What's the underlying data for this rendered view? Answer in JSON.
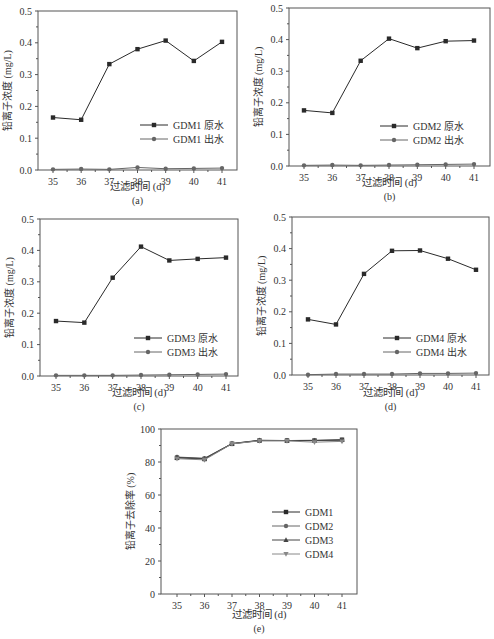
{
  "figure": {
    "caption_partial": "铅离子浓度及去除率随过滤时间变化规律"
  },
  "chart_data": [
    {
      "panel": "(a)",
      "type": "line",
      "xlabel": "过滤时间 (d)",
      "ylabel": "铅离子浓度 (mg/L)",
      "x": [
        35,
        36,
        37,
        38,
        39,
        40,
        41
      ],
      "xticks": [
        "35",
        "36",
        "37",
        "38",
        "39",
        "40",
        "41"
      ],
      "yticks": [
        "0.0",
        "0.1",
        "0.2",
        "0.3",
        "0.4",
        "0.5"
      ],
      "ylim": [
        0,
        0.5
      ],
      "legend_position": "center-right",
      "series": [
        {
          "name": "GDM1 原水",
          "marker": "square",
          "values": [
            0.165,
            0.158,
            0.333,
            0.38,
            0.407,
            0.343,
            0.403
          ]
        },
        {
          "name": "GDM1 出水",
          "marker": "circle",
          "values": [
            0.002,
            0.003,
            0.002,
            0.008,
            0.004,
            0.005,
            0.006
          ]
        }
      ]
    },
    {
      "panel": "(b)",
      "type": "line",
      "xlabel": "过滤时间 (d)",
      "ylabel": "铅离子浓度 (mg/L)",
      "x": [
        35,
        36,
        37,
        38,
        39,
        40,
        41
      ],
      "xticks": [
        "35",
        "36",
        "37",
        "38",
        "39",
        "40",
        "41"
      ],
      "yticks": [
        "0.0",
        "0.1",
        "0.2",
        "0.3",
        "0.4",
        "0.5"
      ],
      "ylim": [
        0,
        0.5
      ],
      "legend_position": "center-right",
      "series": [
        {
          "name": "GDM2 原水",
          "marker": "square",
          "values": [
            0.176,
            0.168,
            0.333,
            0.403,
            0.373,
            0.395,
            0.397
          ]
        },
        {
          "name": "GDM2 出水",
          "marker": "circle",
          "values": [
            0.002,
            0.003,
            0.002,
            0.003,
            0.004,
            0.005,
            0.006
          ]
        }
      ]
    },
    {
      "panel": "(c)",
      "type": "line",
      "xlabel": "过滤时间 (d)",
      "ylabel": "铅离子浓度 (mg/L)",
      "x": [
        35,
        36,
        37,
        38,
        39,
        40,
        41
      ],
      "xticks": [
        "35",
        "36",
        "37",
        "38",
        "39",
        "40",
        "41"
      ],
      "yticks": [
        "0.0",
        "0.1",
        "0.2",
        "0.3",
        "0.4",
        "0.5"
      ],
      "ylim": [
        0,
        0.5
      ],
      "legend_position": "center-right",
      "series": [
        {
          "name": "GDM3 原水",
          "marker": "square",
          "values": [
            0.175,
            0.17,
            0.313,
            0.412,
            0.368,
            0.373,
            0.377
          ]
        },
        {
          "name": "GDM3 出水",
          "marker": "circle",
          "values": [
            0.002,
            0.002,
            0.002,
            0.003,
            0.004,
            0.005,
            0.006
          ]
        }
      ]
    },
    {
      "panel": "(d)",
      "type": "line",
      "xlabel": "过滤时间 (d)",
      "ylabel": "铅离子浓度 (mg/L)",
      "x": [
        35,
        36,
        37,
        38,
        39,
        40,
        41
      ],
      "xticks": [
        "35",
        "36",
        "37",
        "38",
        "39",
        "40",
        "41"
      ],
      "yticks": [
        "0.0",
        "0.1",
        "0.2",
        "0.3",
        "0.4",
        "0.5"
      ],
      "ylim": [
        0,
        0.5
      ],
      "legend_position": "center-right",
      "series": [
        {
          "name": "GDM4 原水",
          "marker": "square",
          "values": [
            0.176,
            0.16,
            0.32,
            0.393,
            0.394,
            0.368,
            0.333
          ]
        },
        {
          "name": "GDM4 出水",
          "marker": "circle",
          "values": [
            0.001,
            0.003,
            0.003,
            0.003,
            0.005,
            0.005,
            0.006
          ]
        }
      ]
    },
    {
      "panel": "(e)",
      "type": "line",
      "xlabel": "过滤时间 (d)",
      "ylabel": "铅离子去除率 (%)",
      "x": [
        35,
        36,
        37,
        38,
        39,
        40,
        41
      ],
      "xticks": [
        "35",
        "36",
        "37",
        "38",
        "39",
        "40",
        "41"
      ],
      "yticks": [
        "0",
        "20",
        "40",
        "60",
        "80",
        "100"
      ],
      "ylim": [
        0,
        100
      ],
      "legend_position": "center-right",
      "series": [
        {
          "name": "GDM1",
          "marker": "square",
          "values": [
            82.5,
            81.8,
            91.0,
            93.0,
            93.0,
            93.0,
            93.5
          ]
        },
        {
          "name": "GDM2",
          "marker": "circle",
          "values": [
            83.0,
            82.3,
            91.2,
            93.0,
            93.0,
            93.2,
            93.2
          ]
        },
        {
          "name": "GDM3",
          "marker": "triangle-up",
          "values": [
            82.8,
            82.0,
            91.2,
            93.2,
            93.0,
            93.0,
            93.3
          ]
        },
        {
          "name": "GDM4",
          "marker": "triangle-down",
          "values": [
            82.0,
            81.3,
            91.0,
            92.8,
            92.8,
            92.0,
            92.5
          ]
        }
      ]
    }
  ]
}
